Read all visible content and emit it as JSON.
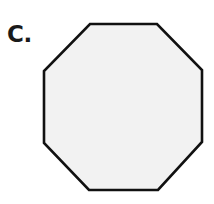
{
  "figure": {
    "label": "C.",
    "background_color": "#ffffff",
    "label_color": "#1a1a1a"
  },
  "shape": {
    "name": "octagon",
    "sides": 8,
    "fill_color": "#f2f2f2",
    "stroke_color": "#111111",
    "stroke_width": 2.6,
    "vertices": "90,24 157,24 202,70 202,142 158,190 89,190 44,143 44,71",
    "vertex_list": [
      [
        90,
        24
      ],
      [
        157,
        24
      ],
      [
        202,
        70
      ],
      [
        202,
        142
      ],
      [
        158,
        190
      ],
      [
        89,
        190
      ],
      [
        44,
        143
      ],
      [
        44,
        71
      ]
    ]
  }
}
